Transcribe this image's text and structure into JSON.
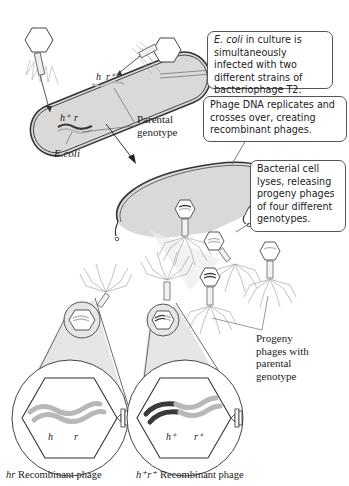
{
  "callouts": {
    "infection": {
      "italic": "E. coli",
      "text": " in culture is simultaneously infected with two different strains of bacteriophage T2."
    },
    "replication": {
      "text": "Phage DNA replicates and crosses over, creating recombinant phages."
    },
    "lysis": {
      "text": "Bacterial cell lyses, releasing progeny phages of four different genotypes."
    }
  },
  "labels": {
    "ecoli": "E.coli",
    "parental_genotype": [
      "Parental",
      "genotype"
    ],
    "progeny_parental": [
      "Progeny",
      "phages with",
      "parental",
      "genotype"
    ],
    "hr_recombinant": {
      "italic": "hr",
      "text": " Recombinant phage"
    },
    "hprp_recombinant": {
      "italic": "h⁺r⁺",
      "text": " Recombinant phage"
    }
  },
  "genes": {
    "parent1": {
      "h": "h⁺",
      "r": "r"
    },
    "parent2": {
      "h": "h",
      "r": "r⁺"
    },
    "recomb_hr": {
      "h": "h",
      "r": "r"
    },
    "recomb_hprp": {
      "h": "h⁺",
      "r": "r⁺"
    }
  },
  "colors": {
    "cell_fill": "#d9d9d9",
    "outline": "#333333",
    "dna_light": "#b8b8b8",
    "dna_dark": "#3a3a3a",
    "zoom_fill": "#e6e6e6"
  }
}
